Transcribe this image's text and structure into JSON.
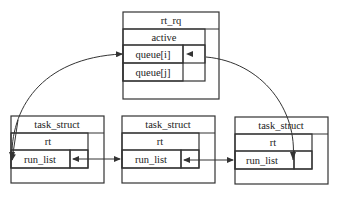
{
  "diagram": {
    "rt_rq": {
      "title": "rt_rq",
      "fields": [
        "active",
        "queue[i]",
        "queue[j]"
      ]
    },
    "tasks": [
      {
        "title": "task_struct",
        "field": "rt",
        "subfield": "run_list"
      },
      {
        "title": "task_struct",
        "field": "rt",
        "subfield": "run_list"
      },
      {
        "title": "task_struct",
        "field": "rt",
        "subfield": "run_list"
      }
    ],
    "links": [
      {
        "from": "queue[i]",
        "to": "task_struct[0].run_list",
        "type": "curved-arrow"
      },
      {
        "from": "task_struct[0].run_list",
        "to": "task_struct[1].run_list",
        "type": "bidirectional"
      },
      {
        "from": "task_struct[1].run_list",
        "to": "task_struct[2].run_list",
        "type": "bidirectional"
      },
      {
        "from": "task_struct[2].run_list",
        "to": "queue[i]",
        "type": "curved-arrow"
      }
    ],
    "colors": {
      "line": "#333333",
      "background": "#ffffff"
    }
  }
}
